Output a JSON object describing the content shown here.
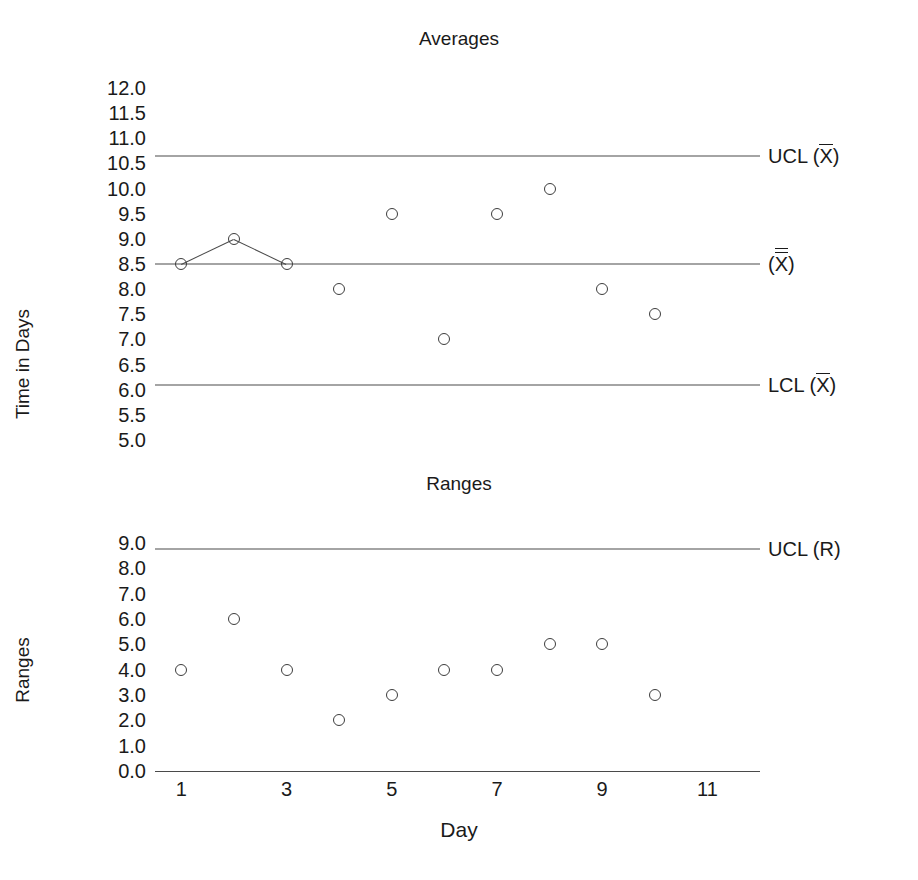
{
  "figure": {
    "x_axis_title": "Day",
    "charts": [
      {
        "id": "averages",
        "title": "Averages",
        "ylabel": "Time in Days"
      },
      {
        "id": "ranges",
        "title": "Ranges",
        "ylabel": "Ranges"
      }
    ]
  },
  "chart_data": [
    {
      "type": "scatter",
      "title": "Averages",
      "xlabel": "Day",
      "ylabel": "Time in Days",
      "x": [
        1,
        2,
        3,
        4,
        5,
        6,
        7,
        8,
        9,
        10
      ],
      "values": [
        8.5,
        9.0,
        8.5,
        8.0,
        9.5,
        7.0,
        9.5,
        10.0,
        8.0,
        7.5
      ],
      "series": [
        {
          "name": "Subgroup average",
          "values": [
            8.5,
            9.0,
            8.5,
            8.0,
            9.5,
            7.0,
            9.5,
            10.0,
            8.0,
            7.5
          ]
        }
      ],
      "xlim": [
        0.5,
        12.0
      ],
      "ylim": [
        5.0,
        12.0
      ],
      "xticks": [
        1,
        3,
        5,
        7,
        9,
        11
      ],
      "xticklabels": [
        "1",
        "3",
        "5",
        "7",
        "9",
        "11"
      ],
      "yticks": [
        5.0,
        5.5,
        6.0,
        6.5,
        7.0,
        7.5,
        8.0,
        8.5,
        9.0,
        9.5,
        10.0,
        10.5,
        11.0,
        11.5,
        12.0
      ],
      "yticklabels": [
        "5.0",
        "5.5",
        "6.0",
        "6.5",
        "7.0",
        "7.5",
        "8.0",
        "8.5",
        "9.0",
        "9.5",
        "10.0",
        "10.5",
        "11.0",
        "11.5",
        "12.0"
      ],
      "grid": false,
      "legend_position": "right-outside",
      "control_lines": [
        {
          "name": "UCL (X-bar)",
          "value": 10.65,
          "label_prefix": "UCL (",
          "label_symbol": "X",
          "label_suffix": ")",
          "bars": 1
        },
        {
          "name": "Center line (X-double-bar)",
          "value": 8.5,
          "label_prefix": "(",
          "label_symbol": "X",
          "label_suffix": ")",
          "bars": 2
        },
        {
          "name": "LCL (X-bar)",
          "value": 6.1,
          "label_prefix": "LCL (",
          "label_symbol": "X",
          "label_suffix": ")",
          "bars": 1
        }
      ]
    },
    {
      "type": "scatter",
      "title": "Ranges",
      "xlabel": "Day",
      "ylabel": "Ranges",
      "x": [
        1,
        2,
        3,
        4,
        5,
        6,
        7,
        8,
        9,
        10
      ],
      "values": [
        4.0,
        6.0,
        4.0,
        2.0,
        3.0,
        4.0,
        4.0,
        5.0,
        5.0,
        3.0
      ],
      "series": [
        {
          "name": "Subgroup range",
          "values": [
            4.0,
            6.0,
            4.0,
            2.0,
            3.0,
            4.0,
            4.0,
            5.0,
            5.0,
            3.0
          ]
        }
      ],
      "xlim": [
        0.5,
        12.0
      ],
      "ylim": [
        0.0,
        9.0
      ],
      "xticks": [
        1,
        3,
        5,
        7,
        9,
        11
      ],
      "xticklabels": [
        "1",
        "3",
        "5",
        "7",
        "9",
        "11"
      ],
      "yticks": [
        0.0,
        1.0,
        2.0,
        3.0,
        4.0,
        5.0,
        6.0,
        7.0,
        8.0,
        9.0
      ],
      "yticklabels": [
        "0.0",
        "1.0",
        "2.0",
        "3.0",
        "4.0",
        "5.0",
        "6.0",
        "7.0",
        "8.0",
        "9.0"
      ],
      "grid": false,
      "legend_position": "right-outside",
      "control_lines": [
        {
          "name": "UCL (R)",
          "value": 8.75,
          "label_prefix": "UCL (",
          "label_symbol": "R",
          "label_suffix": ")",
          "bars": 0
        }
      ]
    }
  ],
  "colors": {
    "line": "#4a4a4a",
    "marker": "#3d3d3d",
    "text": "#1a1a1a",
    "background": "#ffffff"
  }
}
